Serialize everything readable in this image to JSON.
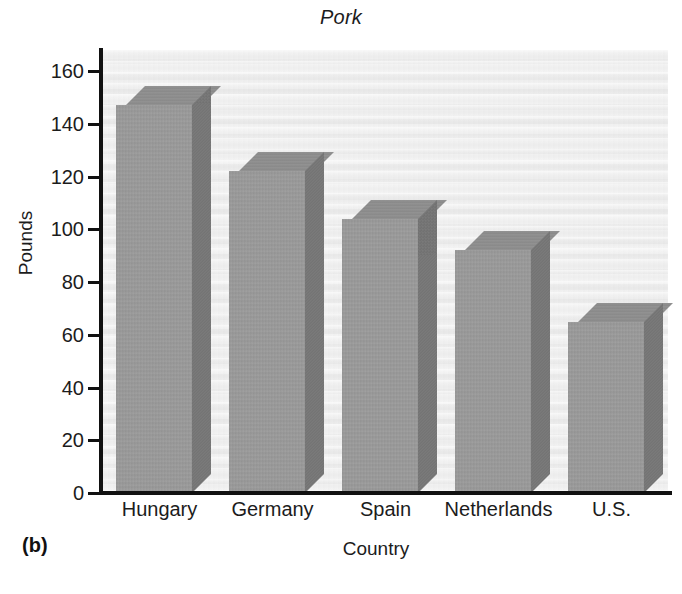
{
  "figure": {
    "panel_label": "(b)",
    "title": "Pork"
  },
  "axes": {
    "y_title": "Pounds",
    "x_title": "Country",
    "y_ticks": [
      "0",
      "20",
      "40",
      "60",
      "80",
      "100",
      "120",
      "140",
      "160"
    ],
    "x_ticks": [
      "Hungary",
      "Germany",
      "Spain",
      "Netherlands",
      "U.S."
    ]
  },
  "colors": {
    "bar_front": "#9b9b9b",
    "bar_top": "#8d8d8d",
    "bar_side": "#757575",
    "plot_background": "#f1f1f1",
    "axis": "#111111",
    "text": "#1c1c1c"
  },
  "chart_data": {
    "type": "bar",
    "title": "Pork",
    "xlabel": "Country",
    "ylabel": "Pounds",
    "categories": [
      "Hungary",
      "Germany",
      "Spain",
      "Netherlands",
      "U.S."
    ],
    "values": [
      147,
      122,
      104,
      92,
      65
    ],
    "ylim": [
      0,
      168
    ],
    "yticks": [
      0,
      20,
      40,
      60,
      80,
      100,
      120,
      140,
      160
    ],
    "grid": false,
    "legend": false,
    "style": "3d-bars",
    "panel": "(b)"
  }
}
